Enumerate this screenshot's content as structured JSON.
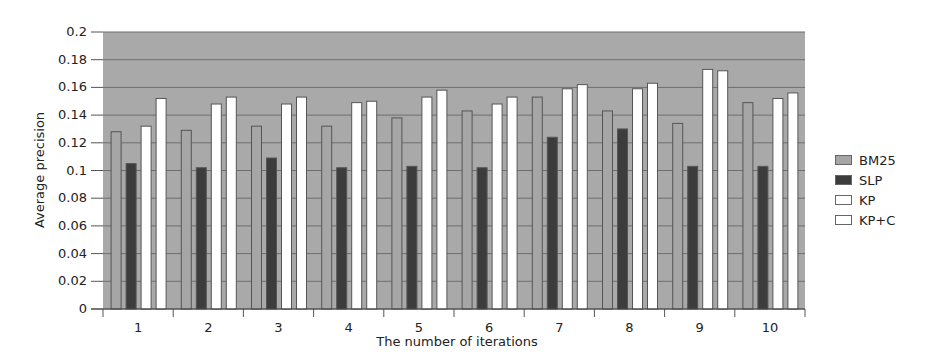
{
  "chart_data": {
    "type": "bar",
    "title": "",
    "xlabel": "The number of iterations",
    "ylabel": "Average precision",
    "ylim": [
      0,
      0.2
    ],
    "yticks": [
      "0",
      "0.02",
      "0.04",
      "0.06",
      "0.08",
      "0.1",
      "0.12",
      "0.14",
      "0.16",
      "0.18",
      "0.2"
    ],
    "grid": true,
    "legend_position": "right",
    "categories": [
      "1",
      "2",
      "3",
      "4",
      "5",
      "6",
      "7",
      "8",
      "9",
      "10"
    ],
    "series": [
      {
        "name": "BM25",
        "color": "#a6a6a6",
        "values": [
          0.128,
          0.129,
          0.132,
          0.132,
          0.138,
          0.143,
          0.153,
          0.143,
          0.134,
          0.149
        ]
      },
      {
        "name": "SLP",
        "color": "#3c3c3c",
        "values": [
          0.105,
          0.102,
          0.109,
          0.102,
          0.103,
          0.102,
          0.124,
          0.13,
          0.103,
          0.103
        ]
      },
      {
        "name": "KP",
        "color": "#ffffff",
        "values": [
          0.132,
          0.148,
          0.148,
          0.149,
          0.153,
          0.148,
          0.159,
          0.159,
          0.173,
          0.152
        ]
      },
      {
        "name": "KP+C",
        "color": "#ffffff",
        "values": [
          0.152,
          0.153,
          0.153,
          0.15,
          0.158,
          0.153,
          0.162,
          0.163,
          0.172,
          0.156
        ]
      }
    ]
  },
  "legend": {
    "items": [
      {
        "label": "BM25",
        "color": "#a6a6a6"
      },
      {
        "label": "SLP",
        "color": "#3c3c3c"
      },
      {
        "label": "KP",
        "color": "#ffffff"
      },
      {
        "label": "KP+C",
        "color": "#ffffff"
      }
    ]
  },
  "colors": {
    "plot_bg": "#a9a9a9",
    "gridline": "#6e6e6e",
    "bar_outline": "#555555"
  }
}
